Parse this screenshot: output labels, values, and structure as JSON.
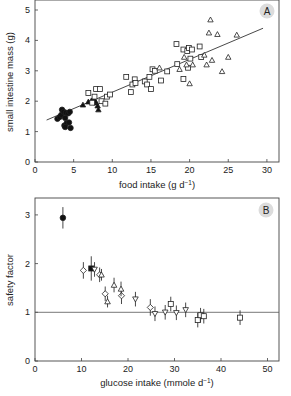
{
  "chart_data": [
    {
      "panel": "A",
      "type": "scatter",
      "xlabel": "food intake (g d⁻¹)",
      "ylabel": "small intestine mass (g)",
      "xlim": [
        0,
        31.5
      ],
      "ylim": [
        0,
        5.3
      ],
      "xticks": [
        0,
        5,
        10,
        15,
        20,
        25,
        30
      ],
      "yticks": [
        0,
        1,
        2,
        3,
        4,
        5
      ],
      "regression_line": {
        "x": [
          1.5,
          29.5
        ],
        "y": [
          1.38,
          4.4
        ]
      },
      "series": [
        {
          "name": "filled circles",
          "marker": "circle-filled",
          "points": [
            [
              2.9,
              1.42
            ],
            [
              3.2,
              1.48
            ],
            [
              3.4,
              1.55
            ],
            [
              3.5,
              1.72
            ],
            [
              3.7,
              1.65
            ],
            [
              3.9,
              1.45
            ],
            [
              4.0,
              1.62
            ],
            [
              4.3,
              1.6
            ],
            [
              4.5,
              1.65
            ],
            [
              3.8,
              1.2
            ],
            [
              4.1,
              1.28
            ],
            [
              4.4,
              1.3
            ],
            [
              3.9,
              1.15
            ],
            [
              4.6,
              1.12
            ]
          ]
        },
        {
          "name": "filled triangles",
          "marker": "triangle-filled",
          "points": [
            [
              6.2,
              1.88
            ],
            [
              6.9,
              1.98
            ],
            [
              7.3,
              2.02
            ],
            [
              7.6,
              2.05
            ],
            [
              7.9,
              1.95
            ],
            [
              8.1,
              1.85
            ],
            [
              8.2,
              1.72
            ],
            [
              7.8,
              2.0
            ]
          ]
        },
        {
          "name": "open squares",
          "marker": "square-open",
          "points": [
            [
              6.9,
              2.27
            ],
            [
              7.4,
              1.95
            ],
            [
              7.7,
              2.15
            ],
            [
              7.9,
              2.4
            ],
            [
              8.4,
              2.4
            ],
            [
              8.6,
              2.0
            ],
            [
              9.1,
              1.92
            ],
            [
              9.3,
              2.15
            ],
            [
              9.7,
              2.22
            ],
            [
              11.8,
              2.8
            ],
            [
              12.4,
              2.3
            ],
            [
              12.6,
              2.55
            ],
            [
              12.9,
              2.72
            ],
            [
              13.0,
              2.6
            ],
            [
              14.2,
              2.65
            ],
            [
              14.5,
              2.55
            ],
            [
              14.8,
              2.8
            ],
            [
              15.0,
              2.4
            ],
            [
              15.2,
              3.05
            ],
            [
              15.5,
              3.0
            ],
            [
              16.3,
              2.68
            ],
            [
              17.1,
              2.98
            ],
            [
              18.3,
              3.88
            ],
            [
              18.4,
              3.22
            ],
            [
              19.2,
              3.7
            ],
            [
              19.2,
              2.73
            ],
            [
              19.7,
              3.65
            ],
            [
              19.9,
              3.75
            ],
            [
              20.1,
              3.4
            ],
            [
              20.3,
              3.7
            ],
            [
              19.8,
              3.1
            ],
            [
              21.3,
              3.8
            ],
            [
              21.5,
              3.45
            ]
          ]
        },
        {
          "name": "open triangles",
          "marker": "triangle-open",
          "points": [
            [
              16.1,
              3.1
            ],
            [
              18.7,
              3.05
            ],
            [
              19.3,
              3.45
            ],
            [
              19.6,
              3.2
            ],
            [
              20.0,
              2.58
            ],
            [
              20.4,
              3.2
            ],
            [
              21.9,
              3.52
            ],
            [
              22.2,
              3.2
            ],
            [
              22.5,
              4.25
            ],
            [
              22.7,
              4.68
            ],
            [
              22.9,
              3.35
            ],
            [
              23.6,
              4.2
            ],
            [
              24.2,
              2.98
            ],
            [
              25.0,
              3.45
            ],
            [
              26.1,
              4.18
            ]
          ]
        }
      ]
    },
    {
      "panel": "B",
      "type": "scatter",
      "xlabel": "glucose intake (mmole d⁻¹)",
      "ylabel": "safety factor",
      "xlim": [
        0,
        52.5
      ],
      "ylim": [
        0,
        3.35
      ],
      "xticks": [
        0,
        10,
        20,
        30,
        40,
        50
      ],
      "yticks": [
        0,
        1,
        2,
        3
      ],
      "reference_line_y": 1,
      "series": [
        {
          "name": "filled circle",
          "marker": "circle-filled",
          "points": [
            [
              6.0,
              2.94,
              0.22
            ]
          ]
        },
        {
          "name": "filled square",
          "marker": "square-filled",
          "points": [
            [
              12.1,
              1.9,
              0.25
            ]
          ]
        },
        {
          "name": "open diamonds",
          "marker": "diamond-open",
          "points": [
            [
              10.4,
              1.86,
              0.17
            ],
            [
              13.9,
              1.77,
              0.15
            ],
            [
              15.1,
              1.38,
              0.15
            ],
            [
              18.6,
              1.34,
              0.17
            ],
            [
              24.8,
              1.1,
              0.17
            ]
          ]
        },
        {
          "name": "open triangles up",
          "marker": "triangle-up-open",
          "points": [
            [
              14.3,
              1.77,
              0.12
            ],
            [
              15.6,
              1.22,
              0.12
            ],
            [
              17.0,
              1.56,
              0.15
            ],
            [
              18.5,
              1.48,
              0.15
            ]
          ]
        },
        {
          "name": "open triangles down",
          "marker": "triangle-down-open",
          "points": [
            [
              12.8,
              1.88,
              0.15
            ],
            [
              21.6,
              1.27,
              0.15
            ],
            [
              25.8,
              0.97,
              0.15
            ],
            [
              28.0,
              1.0,
              0.15
            ],
            [
              30.4,
              0.99,
              0.15
            ],
            [
              32.4,
              1.05,
              0.15
            ]
          ]
        },
        {
          "name": "open squares",
          "marker": "square-open",
          "points": [
            [
              29.2,
              1.17,
              0.15
            ],
            [
              35.0,
              0.84,
              0.15
            ],
            [
              35.6,
              0.94,
              0.15
            ],
            [
              36.3,
              0.92,
              0.15
            ],
            [
              44.1,
              0.89,
              0.15
            ]
          ]
        }
      ]
    }
  ],
  "panels": {
    "a": {
      "badge": "A",
      "xlabel": "food intake (g d",
      "xlabel_sup": "−1",
      "xlabel_end": ")",
      "ylabel": "small intestine mass (g)"
    },
    "b": {
      "badge": "B",
      "xlabel": "glucose intake (mmole d",
      "xlabel_sup": "−1",
      "xlabel_end": ")",
      "ylabel": "safety factor"
    }
  }
}
